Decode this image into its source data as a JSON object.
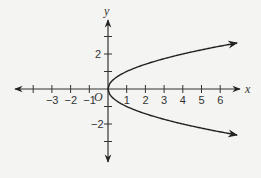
{
  "chart_data": {
    "type": "line",
    "title": "",
    "xlabel": "x",
    "ylabel": "y",
    "origin_label": "O",
    "xlim": [
      -5,
      7
    ],
    "ylim": [
      -4,
      4
    ],
    "grid": false,
    "x_ticks": [
      -4,
      -3,
      -2,
      -1,
      0,
      1,
      2,
      3,
      4,
      5,
      6
    ],
    "x_tick_labels": [
      "-3",
      "-2",
      "-1",
      "1",
      "2",
      "3",
      "4",
      "5",
      "6"
    ],
    "y_ticks": [
      -3,
      -2,
      -1,
      1,
      2,
      3
    ],
    "y_tick_labels": [
      "2",
      "-2"
    ],
    "series": [
      {
        "name": "x = y^2 (upper branch)",
        "equation": "y = sqrt(x)",
        "points": [
          [
            0,
            0
          ],
          [
            1,
            1
          ],
          [
            2,
            1.41
          ],
          [
            3,
            1.73
          ],
          [
            4,
            2
          ],
          [
            5,
            2.24
          ],
          [
            6,
            2.45
          ],
          [
            6.9,
            2.63
          ]
        ],
        "arrow_end": true
      },
      {
        "name": "x = y^2 (lower branch)",
        "equation": "y = -sqrt(x)",
        "points": [
          [
            0,
            0
          ],
          [
            1,
            -1
          ],
          [
            2,
            -1.41
          ],
          [
            3,
            -1.73
          ],
          [
            4,
            -2
          ],
          [
            5,
            -2.24
          ],
          [
            6,
            -2.45
          ],
          [
            6.9,
            -2.63
          ]
        ],
        "arrow_end": true
      }
    ],
    "colors": {
      "curve": "#222222",
      "axis": "#333333"
    }
  }
}
